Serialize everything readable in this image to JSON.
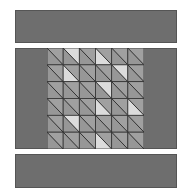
{
  "diagram": {
    "type": "quilt-block",
    "colors": {
      "border": "#6e6e6e",
      "edge": "#555555",
      "medium": "#a0a0a0",
      "medium_alt": "#979797",
      "light": "#dcdcdc",
      "line": "#333333"
    },
    "grid": {
      "rows": 6,
      "cols": 6,
      "diagonal": "top-left to bottom-right",
      "light_triangles": [
        {
          "row": 1,
          "col": 2,
          "half": "upper-right"
        },
        {
          "row": 1,
          "col": 4,
          "half": "lower-left"
        },
        {
          "row": 2,
          "col": 2,
          "half": "lower-left"
        },
        {
          "row": 2,
          "col": 5,
          "half": "upper-right"
        },
        {
          "row": 3,
          "col": 4,
          "half": "upper-right"
        },
        {
          "row": 4,
          "col": 4,
          "half": "lower-left"
        },
        {
          "row": 4,
          "col": 6,
          "half": "lower-left"
        },
        {
          "row": 5,
          "col": 2,
          "half": "upper-right"
        },
        {
          "row": 6,
          "col": 4,
          "half": "lower-left"
        }
      ]
    }
  }
}
